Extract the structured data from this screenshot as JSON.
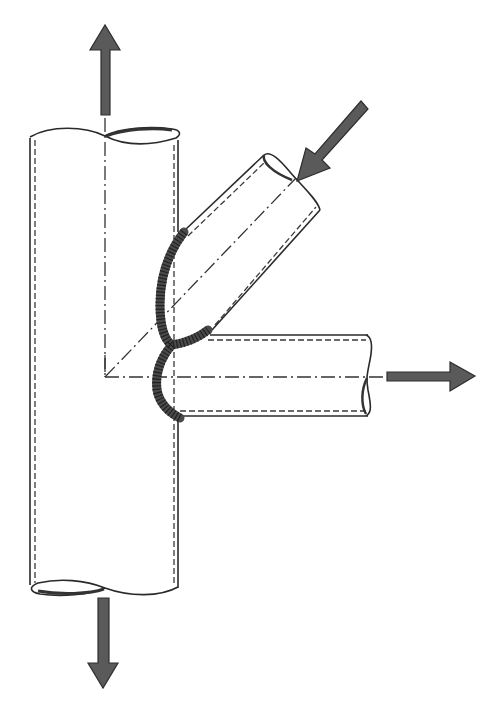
{
  "diagram": {
    "title": "",
    "colors": {
      "background": "#ffffff",
      "line": "#2a2a2a",
      "arrow_fill": "#5a5a5a",
      "weld": "#4a4a4a"
    },
    "components": [
      {
        "id": "chord",
        "label": "vertical chord tube"
      },
      {
        "id": "diagonal-brace",
        "label": "inclined brace tube"
      },
      {
        "id": "horizontal-brace",
        "label": "horizontal brace tube"
      },
      {
        "id": "weld-seam",
        "label": "weld seam at brace-to-chord intersection"
      }
    ],
    "loads": [
      {
        "id": "load-top",
        "direction": "up",
        "meaning": "tension on chord (top)"
      },
      {
        "id": "load-bottom",
        "direction": "down",
        "meaning": "tension on chord (bottom)"
      },
      {
        "id": "load-diagonal",
        "direction": "toward joint",
        "meaning": "compression in diagonal brace"
      },
      {
        "id": "load-horizontal",
        "direction": "right",
        "meaning": "tension in horizontal brace"
      }
    ],
    "line_types": [
      "solid outline",
      "dashed hidden wall",
      "dash-dot centerline"
    ]
  }
}
